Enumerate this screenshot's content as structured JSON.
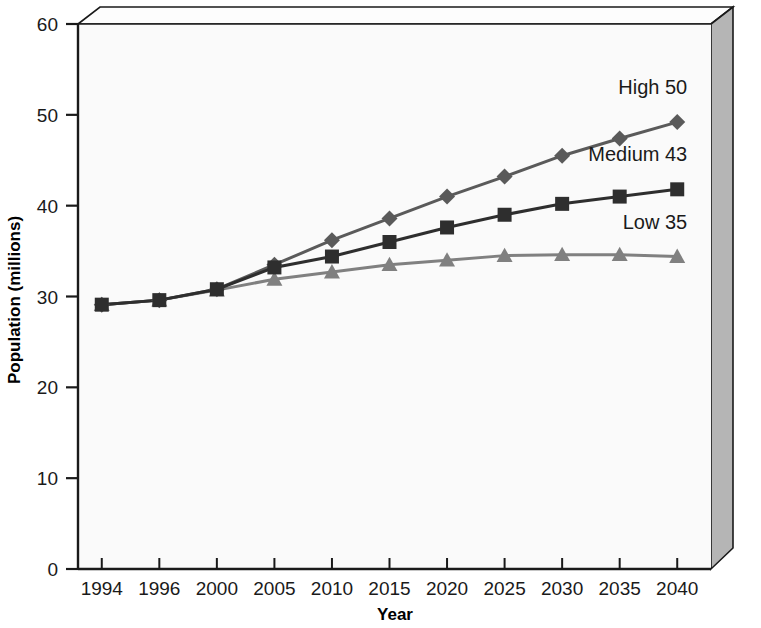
{
  "chart_data": {
    "type": "line",
    "title": "",
    "subtitle": "",
    "xlabel": "Year",
    "ylabel": "Population (millions)",
    "categories": [
      "1994",
      "1996",
      "2000",
      "2005",
      "2010",
      "2015",
      "2020",
      "2025",
      "2030",
      "2035",
      "2040"
    ],
    "ylim": [
      0,
      60
    ],
    "y_ticks": [
      "0",
      "10",
      "20",
      "30",
      "40",
      "50",
      "60"
    ],
    "y_tick_values": [
      0,
      10,
      20,
      30,
      40,
      50,
      60
    ],
    "grid": false,
    "legend_position": "inline-right-end-labels",
    "series": [
      {
        "name": "High",
        "label": "High 50",
        "end_value_label": "50",
        "marker": "diamond",
        "color": "#5a5a5a",
        "values": [
          29.1,
          29.6,
          30.8,
          33.5,
          36.2,
          38.6,
          41.0,
          43.2,
          45.5,
          47.4,
          49.2
        ]
      },
      {
        "name": "Medium",
        "label": "Medium 43",
        "end_value_label": "43",
        "marker": "square",
        "color": "#2e2e2e",
        "values": [
          29.1,
          29.6,
          30.8,
          33.2,
          34.4,
          36.0,
          37.6,
          39.0,
          40.2,
          41.0,
          41.8
        ]
      },
      {
        "name": "Low",
        "label": "Low 35",
        "end_value_label": "35",
        "marker": "triangle",
        "color": "#808080",
        "values": [
          29.1,
          29.6,
          30.7,
          31.9,
          32.7,
          33.5,
          34.0,
          34.5,
          34.6,
          34.6,
          34.4
        ]
      }
    ]
  },
  "colors": {
    "plot_background": "#fafafa",
    "box_side_face": "#b5b5b5",
    "box_top_face": "#fdfdfd",
    "axis": "#1a1a1a"
  }
}
